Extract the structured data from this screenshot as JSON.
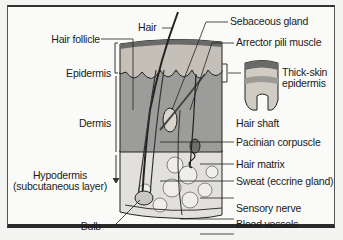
{
  "diagram": {
    "colors": {
      "epidermis": "#b8b4ac",
      "dermis": "#9a9a98",
      "hypodermis": "#e0dedb",
      "outline": "#222222",
      "frame": "#2a2a2a"
    },
    "labels_left": [
      {
        "id": "hair-follicle",
        "text": "Hair follicle"
      },
      {
        "id": "epidermis",
        "text": "Epidermis"
      },
      {
        "id": "dermis",
        "text": "Dermis"
      },
      {
        "id": "hypodermis",
        "text": "Hypodermis"
      },
      {
        "id": "hypodermis-sub",
        "text": "(subcutaneous layer)"
      },
      {
        "id": "bulb",
        "text": "Bulb"
      }
    ],
    "labels_top": [
      {
        "id": "hair",
        "text": "Hair"
      }
    ],
    "labels_right": [
      {
        "id": "sebaceous-gland",
        "text": "Sebaceous gland"
      },
      {
        "id": "arrector-pili-muscle",
        "text": "Arrector pili muscle"
      },
      {
        "id": "thick-skin-1",
        "text": "Thick-skin"
      },
      {
        "id": "thick-skin-2",
        "text": "epidermis"
      },
      {
        "id": "hair-shaft",
        "text": "Hair shaft"
      },
      {
        "id": "pacinian-corpuscle",
        "text": "Pacinian corpuscle"
      },
      {
        "id": "hair-matrix",
        "text": "Hair matrix"
      },
      {
        "id": "sweat-gland",
        "text": "Sweat (eccrine gland)"
      },
      {
        "id": "sensory-nerve",
        "text": "Sensory nerve"
      },
      {
        "id": "blood-vessels",
        "text": "Blood vessels"
      }
    ]
  }
}
